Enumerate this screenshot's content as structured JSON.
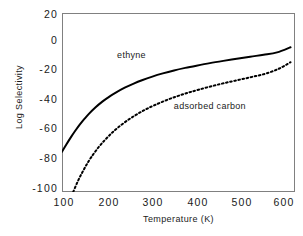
{
  "chart_data": {
    "type": "line",
    "title": "",
    "xlabel": "Temperature  (K)",
    "ylabel": "Log  Selectivity",
    "xlim": [
      100,
      620
    ],
    "ylim": [
      -100,
      20
    ],
    "xticks": [
      100,
      200,
      300,
      400,
      500,
      600
    ],
    "yticks": [
      20,
      0,
      -20,
      -40,
      -60,
      -80,
      -100
    ],
    "xtick_labels": [
      "100",
      "200",
      "300",
      "400",
      "500",
      "600"
    ],
    "ytick_labels": [
      "20",
      "0",
      "-20",
      "-40",
      "-60",
      "-80",
      "-100"
    ],
    "grid": false,
    "legend": "inline-annotations",
    "frame": true,
    "series": [
      {
        "name": "ethyne",
        "style": "solid",
        "color": "#000000",
        "label_position": {
          "x": 255,
          "y": -9
        },
        "x": [
          100,
          110,
          120,
          130,
          140,
          150,
          160,
          175,
          190,
          205,
          220,
          240,
          260,
          280,
          300,
          325,
          350,
          375,
          400,
          430,
          460,
          490,
          520,
          550,
          580,
          610
        ],
        "y": [
          -73.0,
          -68.0,
          -63.2,
          -58.8,
          -54.7,
          -51.0,
          -47.6,
          -43.2,
          -39.4,
          -36.2,
          -33.4,
          -30.1,
          -27.3,
          -24.9,
          -22.8,
          -20.5,
          -18.5,
          -16.8,
          -15.3,
          -13.6,
          -12.1,
          -10.7,
          -9.3,
          -8.0,
          -6.4,
          -3.0
        ]
      },
      {
        "name": "adsorbed carbon",
        "style": "dotted",
        "color": "#000000",
        "label_position": {
          "x": 430,
          "y": -43
        },
        "x": [
          125,
          135,
          145,
          155,
          165,
          180,
          195,
          210,
          225,
          245,
          265,
          285,
          305,
          330,
          355,
          380,
          405,
          435,
          465,
          495,
          525,
          555,
          585,
          610
        ],
        "y": [
          -100.0,
          -93.0,
          -87.0,
          -81.6,
          -76.8,
          -70.6,
          -65.4,
          -60.8,
          -56.8,
          -52.2,
          -48.3,
          -44.9,
          -42.0,
          -38.8,
          -36.0,
          -33.6,
          -31.4,
          -29.0,
          -26.8,
          -24.8,
          -22.8,
          -20.6,
          -17.2,
          -13.0
        ]
      }
    ]
  },
  "labels": {
    "ethyne": "ethyne",
    "adsorbed_carbon": "adsorbed carbon"
  }
}
